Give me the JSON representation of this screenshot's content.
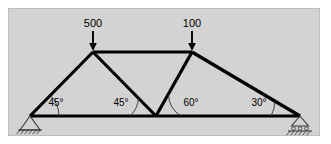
{
  "figure": {
    "type": "truss-diagram",
    "panel": {
      "x": 8,
      "y": 8,
      "width": 312,
      "height": 128,
      "fill": "#d3d3d3",
      "border": "#bdbdbd"
    }
  },
  "loads": [
    {
      "id": "load-500",
      "label": "500",
      "label_x": 93,
      "label_y": 27,
      "arrow_x": 93,
      "arrow_top_y": 31,
      "arrow_tip_y": 50,
      "applied_at": "top-left-joint"
    },
    {
      "id": "load-100",
      "label": "100",
      "label_x": 192,
      "label_y": 27,
      "arrow_x": 192,
      "arrow_top_y": 31,
      "arrow_tip_y": 50,
      "applied_at": "top-right-joint"
    }
  ],
  "joints": {
    "left_support": {
      "x": 30,
      "y": 116
    },
    "top_left": {
      "x": 93,
      "y": 52
    },
    "top_right": {
      "x": 192,
      "y": 52
    },
    "bottom_center": {
      "x": 156,
      "y": 116
    },
    "right_support": {
      "x": 300,
      "y": 116
    }
  },
  "members": [
    {
      "name": "bottom-chord",
      "from": "left_support",
      "to": "right_support",
      "path": "M 30 116 L 300 116"
    },
    {
      "name": "left-inclined-chord",
      "from": "left_support",
      "to": "top_left",
      "path": "M 30 116 L 93 52"
    },
    {
      "name": "top-chord",
      "from": "top_left",
      "to": "top_right",
      "path": "M 93 52 L 192 52"
    },
    {
      "name": "left-diagonal",
      "from": "top_left",
      "to": "bottom_center",
      "path": "M 93 52 L 156 116"
    },
    {
      "name": "right-diagonal",
      "from": "bottom_center",
      "to": "top_right",
      "path": "M 156 116 L 192 52"
    },
    {
      "name": "right-inclined-chord",
      "from": "top_right",
      "to": "right_support",
      "path": "M 192 52 L 300 116"
    }
  ],
  "angles": [
    {
      "id": "angle-left-support",
      "label": "45°",
      "value": 45,
      "unit": "degrees",
      "label_x": 56,
      "label_y": 106,
      "arc_path": "M 59 116 A 29 29 0 0 0 50.5 95.5",
      "at_joint": "left_support"
    },
    {
      "id": "angle-left-diagonal",
      "label": "45°",
      "value": 45,
      "unit": "degrees",
      "label_x": 121,
      "label_y": 106,
      "arc_path": "M 130 116 A 26 26 0 0 0 138.5 97.5",
      "at_joint": "bottom_center"
    },
    {
      "id": "angle-right-diagonal",
      "label": "60°",
      "value": 60,
      "unit": "degrees",
      "label_x": 191,
      "label_y": 106,
      "arc_path": "M 168.5 94.5 A 25 25 0 0 0 181 116",
      "at_joint": "bottom_center"
    },
    {
      "id": "angle-right-support",
      "label": "30°",
      "value": 30,
      "unit": "degrees",
      "label_x": 259,
      "label_y": 106,
      "arc_path": "M 271 116 A 29 29 0 0 0 274.8 101.5",
      "at_joint": "right_support"
    }
  ],
  "supports": [
    {
      "id": "left-pin-support",
      "kind": "pin",
      "x": 30,
      "y": 116,
      "triangle": "M 30 116 L 20 130 L 40 130 Z",
      "base_y": 130,
      "base_x1": 18,
      "base_x2": 42,
      "hatch_count": 6
    },
    {
      "id": "right-roller-support",
      "kind": "roller",
      "x": 300,
      "y": 116,
      "triangle": "M 300 116 L 291.5 126 L 308.5 126 Z",
      "roller_y": 128.5,
      "roller_r": 1.8,
      "roller_xs": [
        293.5,
        300,
        306.5
      ],
      "base_y": 131,
      "base_x1": 288,
      "base_x2": 312,
      "hatch_count": 6
    }
  ],
  "colors": {
    "member": "#000000",
    "panel_fill": "#d3d3d3",
    "panel_border": "#bdbdbd",
    "support": "#3a3a3a",
    "text": "#000000"
  }
}
